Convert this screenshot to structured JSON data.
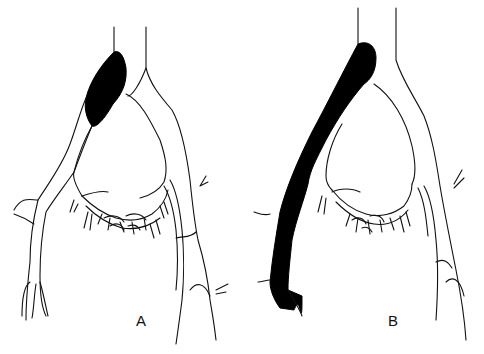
{
  "figure": {
    "panels": [
      {
        "id": "A",
        "label": "A",
        "description": "Venous drainage with dilated (black-filled) segment at upper left branch"
      },
      {
        "id": "B",
        "label": "B",
        "description": "Venous drainage with entire left trunk filled black down to bifurcation"
      }
    ],
    "colors": {
      "ink": "#111111",
      "fill": "#000000",
      "background": "#ffffff"
    }
  }
}
